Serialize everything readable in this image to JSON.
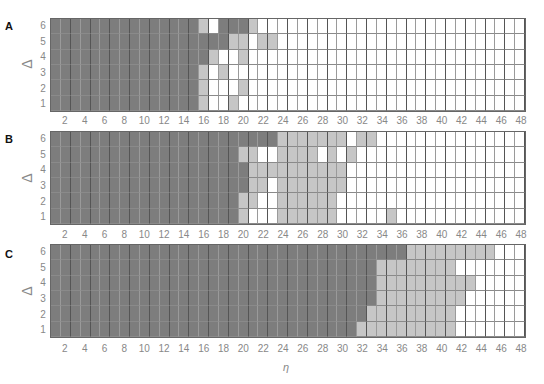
{
  "chart_data": {
    "type": "heatmap",
    "title": "",
    "xlabel": "η",
    "ylabel": "Δ",
    "x_range": [
      1,
      48
    ],
    "y_range": [
      1,
      6
    ],
    "x_tick_labels": [
      "2",
      "4",
      "6",
      "8",
      "10",
      "12",
      "14",
      "16",
      "18",
      "20",
      "22",
      "24",
      "26",
      "28",
      "30",
      "32",
      "34",
      "36",
      "38",
      "40",
      "42",
      "44",
      "46",
      "48"
    ],
    "y_tick_labels": [
      "6",
      "5",
      "4",
      "3",
      "2",
      "1"
    ],
    "legend": {
      "D": "dark gray",
      "L": "light gray",
      "W": "white"
    },
    "colors": {
      "D": "#7d7d7d",
      "L": "#c6c6c6",
      "W": "#ffffff"
    },
    "panels": [
      {
        "label": "A",
        "rows": {
          "6": "DDDDDDDDDDDDDDDLWDDDLWWWWWWWWWWWWWWWWWWWWWWWWWWW",
          "5": "DDDDDDDDDDDDDDDDDDLLWLLWWWWWWWWWWWWWWWWWWWWWWWWW",
          "4": "DDDDDDDDDDDDDDDDLWWLWWWWWWWWWWWWWWWWWWWWWWWWWWWW",
          "3": "DDDDDDDDDDDDDDDLWLWWWWWWWWWWWWWWWWWWWWWWWWWWWWWW",
          "2": "DDDDDDDDDDDDDDDLWWWLWWWWWWWWWWWWWWWWWWWWWWWWWWWW",
          "1": "DDDDDDDDDDDDDDDLWWLWWWWWWWWWWWWWWWWWWWWWWWWWWWWW"
        }
      },
      {
        "label": "B",
        "rows": {
          "6": "DDDDDDDDDDDDDDDDDDDDDDDLLLLLLLWLLWWWWWWWWWWWWWWW",
          "5": "DDDDDDDDDDDDDDDDDDDLLWWLLLLWLWLWWWWWWWWWWWWWWWWW",
          "4": "DDDDDDDDDDDDDDDDDDDDLLLLLLLLLLWWWWWWWWWWWWWWWWWW",
          "3": "DDDDDDDDDDDDDDDDDDDDLLWLLLLLLLWWWWWWWWWWWWWWWWWW",
          "2": "DDDDDDDDDDDDDDDDDDDLLWWLLLLLLWWWWWWWWWWWWWWWWWWW",
          "1": "DDDDDDDDDDDDDDDDDDDLWWWLLLLLLWWWWWLWWWWWWWWWWWWW"
        }
      },
      {
        "label": "C",
        "rows": {
          "6": "DDDDDDDDDDDDDDDDDDDDDDDDDDDDDDDDDDDDLLLLLLLLLWWW",
          "5": "DDDDDDDDDDDDDDDDDDDDDDDDDDDDDDDDDLLLLLLLLWWWWWWW",
          "4": "DDDDDDDDDDDDDDDDDDDDDDDDDDDDDDDDDLLLLLLLLLLWWWWW",
          "3": "DDDDDDDDDDDDDDDDDDDDDDDDDDDDDDDDDLLLLLLLLLWWWWWW",
          "2": "DDDDDDDDDDDDDDDDDDDDDDDDDDDDDDDDLLLLLLLLLWWWWWWW",
          "1": "DDDDDDDDDDDDDDDDDDDDDDDDDDDDDDDLLLLLLLLLLWWWWWWW"
        }
      }
    ]
  },
  "panels": [
    {
      "label": "A",
      "ylabel": "Δ"
    },
    {
      "label": "B",
      "ylabel": "Δ"
    },
    {
      "label": "C",
      "ylabel": "Δ"
    }
  ],
  "xlabel": "η"
}
